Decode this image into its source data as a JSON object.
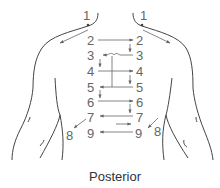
{
  "caption": "Posterior",
  "colors": {
    "outline": "#444444",
    "arrow": "#666666",
    "label": "#666666",
    "caption": "#333333",
    "background": "#ffffff"
  },
  "labels": {
    "left": [
      "1",
      "2",
      "3",
      "4",
      "5",
      "6",
      "7",
      "8",
      "9"
    ],
    "right": [
      "1",
      "2",
      "3",
      "4",
      "5",
      "6",
      "7",
      "8",
      "9"
    ]
  },
  "sequence": [
    {
      "step": "1",
      "description": "Top of shoulders, arrows sweep outward along shoulders"
    },
    {
      "step": "2",
      "description": "Arrow left to right"
    },
    {
      "step": "3",
      "description": "Arrow right to left (down from 2 right)"
    },
    {
      "step": "4",
      "description": "Arrow left to right"
    },
    {
      "step": "5",
      "description": "Arrow right to left"
    },
    {
      "step": "6",
      "description": "Arrow left to right"
    },
    {
      "step": "7",
      "description": "Arrow right to left"
    },
    {
      "step": "8",
      "description": "Lateral points, arrows from 7 outward"
    },
    {
      "step": "9",
      "description": "Arrow right to left"
    }
  ]
}
